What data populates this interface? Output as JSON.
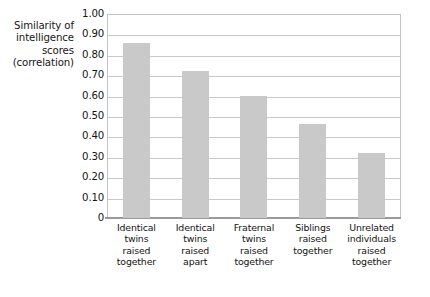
{
  "chart_data": {
    "type": "bar",
    "title": "",
    "xlabel": "",
    "ylabel": "Similarity of intelligence scores (correlation)",
    "ylabel_lines": [
      "Similarity of",
      "intelligence",
      "scores",
      "(correlation)"
    ],
    "categories": [
      "Identical twins raised together",
      "Identical twins raised apart",
      "Fraternal twins raised together",
      "Siblings raised together",
      "Unrelated individuals raised together"
    ],
    "category_lines": [
      [
        "Identical",
        "twins",
        "raised",
        "together"
      ],
      [
        "Identical",
        "twins",
        "raised",
        "apart"
      ],
      [
        "Fraternal",
        "twins",
        "raised",
        "together"
      ],
      [
        "Siblings",
        "raised",
        "together"
      ],
      [
        "Unrelated",
        "individuals",
        "raised",
        "together"
      ]
    ],
    "values": [
      0.86,
      0.72,
      0.6,
      0.46,
      0.32
    ],
    "ylim": [
      0,
      1.0
    ],
    "ytick_values": [
      1.0,
      0.9,
      0.8,
      0.7,
      0.6,
      0.5,
      0.4,
      0.3,
      0.2,
      0.1,
      0
    ],
    "ytick_labels": [
      "1.00",
      "0.90",
      "0.80",
      "0.70",
      "0.60",
      "0.50",
      "0.40",
      "0.30",
      "0.20",
      "0.10",
      "0"
    ],
    "grid": true,
    "legend": "none",
    "bar_color": "#c9c9c9",
    "gridline_color": "#c9c9c9",
    "axis_color": "#9a9a9a"
  }
}
